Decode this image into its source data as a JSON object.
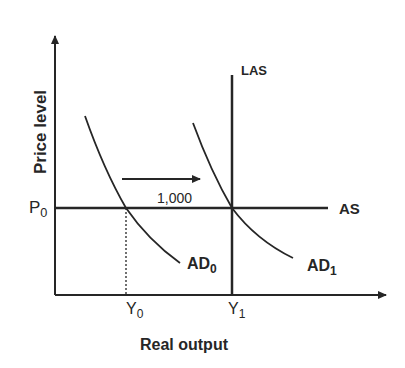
{
  "diagram": {
    "type": "AD-AS shift diagram",
    "y_axis_label": "Price level",
    "x_axis_label": "Real output",
    "curves": {
      "las": {
        "label": "LAS"
      },
      "as": {
        "label": "AS"
      },
      "ad0": {
        "label_main": "AD",
        "label_sub": "0"
      },
      "ad1": {
        "label_main": "AD",
        "label_sub": "1"
      }
    },
    "price_tick": {
      "main": "P",
      "sub": "0"
    },
    "output_ticks": [
      {
        "main": "Y",
        "sub": "0"
      },
      {
        "main": "Y",
        "sub": "1"
      }
    ],
    "shift_arrow": {
      "label": "1,000",
      "direction": "right"
    },
    "colors": {
      "line": "#262626",
      "background": "#ffffff"
    }
  }
}
